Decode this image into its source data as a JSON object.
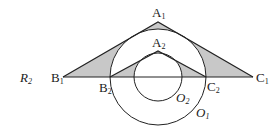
{
  "figure": {
    "region_label": {
      "main": "R",
      "sub": "2"
    },
    "points": {
      "A1": {
        "main": "A",
        "sub": "1"
      },
      "A2": {
        "main": "A",
        "sub": "2"
      },
      "B1": {
        "main": "B",
        "sub": "1"
      },
      "B2": {
        "main": "B",
        "sub": "2"
      },
      "C1": {
        "main": "C",
        "sub": "1"
      },
      "C2": {
        "main": "C",
        "sub": "2"
      }
    },
    "circles": {
      "O1": {
        "main": "O",
        "sub": "1"
      },
      "O2": {
        "main": "O",
        "sub": "2"
      }
    },
    "colors": {
      "stroke": "#222222",
      "shade": "#c8c8c8",
      "background": "#ffffff"
    }
  }
}
